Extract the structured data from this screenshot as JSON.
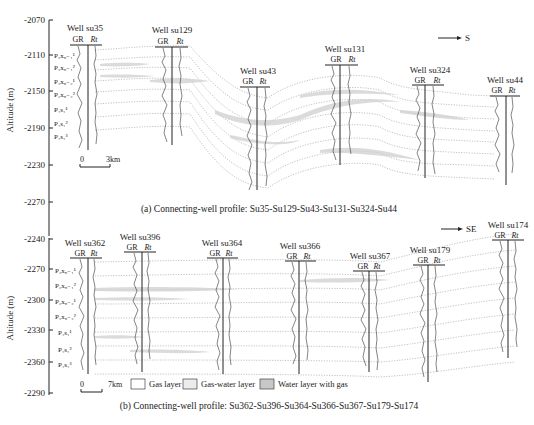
{
  "panel_a": {
    "caption": "(a) Connecting-well profile: Su35-Su129-Su43-Su131-Su324-Su44",
    "direction": "S",
    "ylabel": "Altitude (m)",
    "yticks": [
      "-2070",
      "-2110",
      "-2150",
      "-2190",
      "-2230",
      "-2270"
    ],
    "scale": {
      "zero": "0",
      "dist": "3km"
    },
    "layers": [
      "P₂x₈₋₁¹",
      "P₂x₈₋₁²",
      "P₂x₈₋₂¹",
      "P₂x₈₋₂²",
      "P₁s₁¹",
      "P₁s₁²",
      "P₁s₁³"
    ],
    "wells": [
      {
        "name": "Well su35",
        "gr": "GR",
        "rt": "Rt"
      },
      {
        "name": "Well su129",
        "gr": "GR",
        "rt": "Rt"
      },
      {
        "name": "Well su43",
        "gr": "GR",
        "rt": "Rt"
      },
      {
        "name": "Well su131",
        "gr": "GR",
        "rt": "Rt"
      },
      {
        "name": "Well su324",
        "gr": "GR",
        "rt": "Rt"
      },
      {
        "name": "Well su44",
        "gr": "GR",
        "rt": "Rt"
      }
    ]
  },
  "panel_b": {
    "caption": "(b) Connecting-well profile: Su362-Su396-Su364-Su366-Su367-Su179-Su174",
    "direction": "SE",
    "ylabel": "Altitude (m)",
    "yticks": [
      "-2240",
      "-2270",
      "-2300",
      "-2330",
      "-2360",
      "-2290"
    ],
    "scale": {
      "zero": "0",
      "dist": "7km"
    },
    "layers": [
      "P₂x₈₋₁¹",
      "P₂x₈₋₁²",
      "P₂x₈₋₂¹",
      "P₂x₈₋₂²",
      "P₁s₁¹",
      "P₁s₁²",
      "P₁s₁³"
    ],
    "wells": [
      {
        "name": "Well su362",
        "gr": "GR",
        "rt": "Rt"
      },
      {
        "name": "Well su396",
        "gr": "GR",
        "rt": "Rt"
      },
      {
        "name": "Well su364",
        "gr": "GR",
        "rt": "Rt"
      },
      {
        "name": "Well su366",
        "gr": "GR",
        "rt": "Rt"
      },
      {
        "name": "Well su367",
        "gr": "GR",
        "rt": "Rt"
      },
      {
        "name": "Well su179",
        "gr": "GR",
        "rt": "Rt"
      },
      {
        "name": "Well su174",
        "gr": "GR",
        "rt": "Rt"
      }
    ]
  },
  "legend": [
    {
      "label": "Gas layer",
      "color": "#ffffff"
    },
    {
      "label": "Gas-water layer",
      "color": "#eeeeee"
    },
    {
      "label": "Water layer with gas",
      "color": "#c8c8c8"
    }
  ]
}
